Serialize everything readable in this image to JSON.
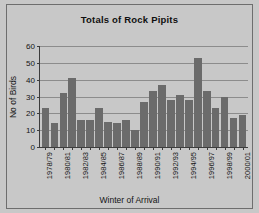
{
  "chart_data": {
    "type": "bar",
    "title": "Totals of Rock Pipits",
    "xlabel": "Winter of Arrival",
    "ylabel": "No of Birds",
    "ylim": [
      0,
      60
    ],
    "yticks": [
      0,
      10,
      20,
      30,
      40,
      50,
      60
    ],
    "grid": true,
    "legend": false,
    "categories": [
      "1978/79",
      "1979/80",
      "1980/81",
      "1981/82",
      "1982/83",
      "1983/84",
      "1984/85",
      "1985/86",
      "1986/87",
      "1987/88",
      "1988/89",
      "1989/90",
      "1990/91",
      "1991/92",
      "1992/93",
      "1993/94",
      "1994/95",
      "1995/96",
      "1996/97",
      "1997/98",
      "1998/99",
      "1999/00",
      "2000/01"
    ],
    "tick_labels": [
      "1978/79",
      "",
      "1980/81",
      "",
      "1982/83",
      "",
      "1984/85",
      "",
      "1986/87",
      "",
      "1988/89",
      "",
      "1990/91",
      "",
      "1992/93",
      "",
      "1994/95",
      "",
      "1996/97",
      "",
      "1998/99",
      "",
      "2000/01"
    ],
    "values": [
      23,
      14,
      32,
      41,
      16,
      16,
      23,
      15,
      14,
      16,
      10,
      27,
      33,
      37,
      28,
      31,
      28,
      53,
      33,
      23,
      30,
      17,
      19
    ]
  },
  "colors": {
    "background": "#c8c8c8",
    "bar": "#6b6b6b",
    "axis": "#3c3c3c",
    "gridline": "#8c8c8c",
    "frame": "#6e6e6e",
    "text": "#141414"
  }
}
